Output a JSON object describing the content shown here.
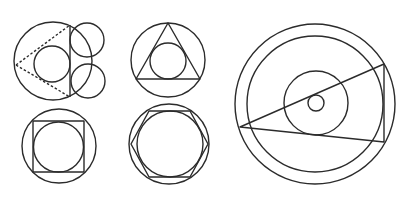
{
  "canvas": {
    "width": 415,
    "height": 200,
    "background": "#ffffff",
    "stroke": "#2b2b2b"
  },
  "figures": [
    {
      "name": "figure-circle-with-dashed-triangle-and-tangent-circles",
      "circles": [
        {
          "name": "outer-circle",
          "cx": 53,
          "cy": 61,
          "r": 39
        },
        {
          "name": "inner-circle",
          "cx": 52,
          "cy": 64,
          "r": 18
        },
        {
          "name": "upper-right-circle",
          "cx": 87,
          "cy": 40,
          "r": 17
        },
        {
          "name": "lower-right-circle",
          "cx": 88,
          "cy": 81,
          "r": 17
        }
      ],
      "lines": [
        {
          "name": "vertical-chord",
          "x1": 70,
          "y1": 25,
          "x2": 70,
          "y2": 97,
          "dashed": false
        },
        {
          "name": "dashed-upper-side",
          "x1": 16,
          "y1": 65,
          "x2": 70,
          "y2": 25,
          "dashed": true
        },
        {
          "name": "dashed-lower-side",
          "x1": 16,
          "y1": 65,
          "x2": 70,
          "y2": 97,
          "dashed": true
        }
      ],
      "polygons": []
    },
    {
      "name": "figure-triangle-in-circle",
      "circles": [
        {
          "name": "outer-circle",
          "cx": 168,
          "cy": 60,
          "r": 37
        },
        {
          "name": "incircle",
          "cx": 168,
          "cy": 61,
          "r": 18
        }
      ],
      "lines": [],
      "polygons": [
        {
          "name": "inscribed-triangle",
          "points": "168,23 136,79 200,79"
        }
      ]
    },
    {
      "name": "figure-square-in-circle",
      "circles": [
        {
          "name": "outer-circle",
          "cx": 59,
          "cy": 146,
          "r": 37
        },
        {
          "name": "inner-circle",
          "cx": 58.5,
          "cy": 147,
          "r": 25
        }
      ],
      "lines": [],
      "polygons": [
        {
          "name": "inscribed-square",
          "points": "33,121 84,121 84,172 33,172"
        }
      ]
    },
    {
      "name": "figure-hexagon-in-circle",
      "circles": [
        {
          "name": "outer-circle",
          "cx": 169,
          "cy": 144,
          "r": 40
        },
        {
          "name": "inner-circle",
          "cx": 170,
          "cy": 144,
          "r": 33
        }
      ],
      "lines": [],
      "polygons": [
        {
          "name": "inscribed-hexagon",
          "points": "131,144 149,111 190,111 208,144 190,177 149,177"
        }
      ]
    },
    {
      "name": "figure-concentric-circles-with-triangle",
      "circles": [
        {
          "name": "outermost-circle",
          "cx": 315,
          "cy": 104,
          "r": 80
        },
        {
          "name": "second-circle",
          "cx": 315,
          "cy": 104,
          "r": 68
        },
        {
          "name": "middle-circle",
          "cx": 316,
          "cy": 103,
          "r": 32
        },
        {
          "name": "center-small-circle",
          "cx": 316,
          "cy": 103,
          "r": 8
        }
      ],
      "lines": [],
      "polygons": [
        {
          "name": "triangle",
          "points": "240,127 384,64 384,142"
        }
      ]
    }
  ]
}
